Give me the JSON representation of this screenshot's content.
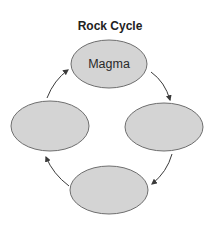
{
  "diagram": {
    "title": "Rock Cycle",
    "colors": {
      "node_fill": "#d4d4d4",
      "node_stroke": "#6e6e6e",
      "arrow": "#3a3a3a",
      "text": "#222222"
    },
    "nodes": [
      {
        "id": "top",
        "label": "Magma"
      },
      {
        "id": "right",
        "label": ""
      },
      {
        "id": "bottom",
        "label": ""
      },
      {
        "id": "left",
        "label": ""
      }
    ],
    "edges": [
      {
        "from": "top",
        "to": "right",
        "direction": "clockwise"
      },
      {
        "from": "right",
        "to": "bottom",
        "direction": "clockwise"
      },
      {
        "from": "bottom",
        "to": "left",
        "direction": "clockwise"
      },
      {
        "from": "left",
        "to": "top",
        "direction": "clockwise"
      }
    ]
  }
}
